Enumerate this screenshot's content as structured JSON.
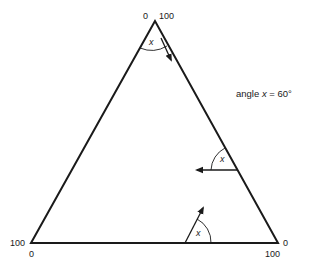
{
  "diagram": {
    "type": "ternary-triangle-reading-guide",
    "annotation": {
      "prefix": "angle ",
      "variable": "x",
      "suffix": " = 60°"
    },
    "vertex_labels": {
      "top_left": "0",
      "top_right": "100",
      "bottom_left_side": "100",
      "bottom_left_below": "0",
      "bottom_right_side": "0",
      "bottom_right_below": "100"
    },
    "angle_markers": [
      {
        "location": "top-vertex",
        "label": "x"
      },
      {
        "location": "right-edge",
        "label": "x"
      },
      {
        "location": "bottom-edge",
        "label": "x"
      }
    ],
    "colors": {
      "line": "#1a1a1a",
      "background": "#ffffff"
    }
  }
}
